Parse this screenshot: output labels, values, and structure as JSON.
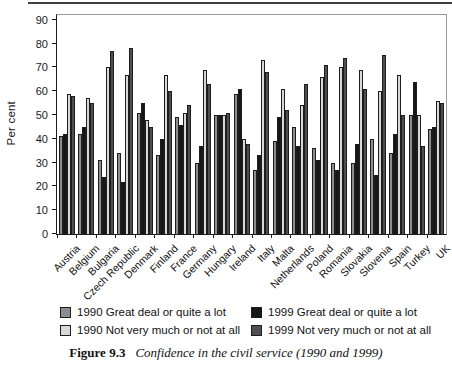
{
  "chart_data": {
    "type": "bar",
    "title": "",
    "xlabel": "",
    "ylabel": "Per cent",
    "ylim": [
      0,
      90
    ],
    "yticks": [
      0,
      10,
      20,
      30,
      40,
      50,
      60,
      70,
      80,
      90
    ],
    "grid": false,
    "legend_position": "bottom",
    "bar_outline": "#1d1d1d",
    "categories": [
      "Austria",
      "Belgium",
      "Bulgaria",
      "Czech Republic",
      "Denmark",
      "Finland",
      "France",
      "Germany",
      "Hungary",
      "Ireland",
      "Italy",
      "Malta",
      "Netherlands",
      "Poland",
      "Romania",
      "Slovakia",
      "Slovenia",
      "Spain",
      "Turkey",
      "UK"
    ],
    "series": [
      {
        "name": "1990 Great deal or quite a lot",
        "color": "#8e8e8e",
        "values": [
          41,
          42,
          31,
          34,
          51,
          33,
          49,
          30,
          50,
          59,
          27,
          39,
          45,
          36,
          30,
          30,
          40,
          34,
          50,
          44
        ]
      },
      {
        "name": "1999 Great deal or quite a lot",
        "color": "#161616",
        "values": [
          42,
          45,
          24,
          22,
          55,
          40,
          46,
          37,
          50,
          61,
          33,
          49,
          37,
          31,
          27,
          38,
          25,
          42,
          64,
          45
        ]
      },
      {
        "name": "1990 Not very much or not at all",
        "color": "#d8d8d8",
        "values": [
          59,
          57,
          70,
          67,
          48,
          67,
          51,
          69,
          50,
          40,
          73,
          61,
          54,
          66,
          70,
          69,
          60,
          67,
          50,
          56
        ]
      },
      {
        "name": "1999 Not very much or not at all",
        "color": "#4f4f4f",
        "values": [
          58,
          55,
          77,
          78,
          45,
          60,
          54,
          63,
          51,
          38,
          68,
          52,
          63,
          71,
          74,
          61,
          75,
          50,
          37,
          55
        ]
      }
    ]
  },
  "caption": {
    "label": "Figure 9.3",
    "text": "Confidence in the civil service (1990 and 1999)"
  }
}
